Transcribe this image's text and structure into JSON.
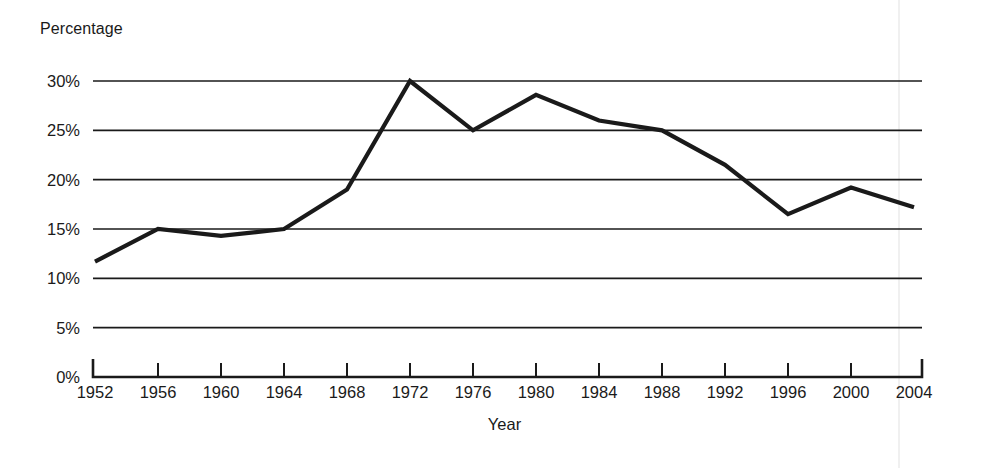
{
  "chart_data": {
    "type": "line",
    "title": "",
    "ylabel": "Percentage",
    "xlabel": "Year",
    "categories": [
      "1952",
      "1956",
      "1960",
      "1964",
      "1968",
      "1972",
      "1976",
      "1980",
      "1984",
      "1988",
      "1992",
      "1996",
      "2000",
      "2004"
    ],
    "x": [
      1952,
      1956,
      1960,
      1964,
      1968,
      1972,
      1976,
      1980,
      1984,
      1988,
      1992,
      1996,
      2000,
      2004
    ],
    "values": [
      11.7,
      15.0,
      14.3,
      15.0,
      19.0,
      30.0,
      25.0,
      28.6,
      26.0,
      25.0,
      21.5,
      16.5,
      19.2,
      17.2
    ],
    "ylim": [
      0,
      30
    ],
    "ytick_values": [
      0,
      5,
      10,
      15,
      20,
      25,
      30
    ],
    "ytick_labels": [
      "0%",
      "5%",
      "10%",
      "15%",
      "20%",
      "25%",
      "30%"
    ],
    "grid": "horizontal",
    "legend": "none",
    "series_color": "#1a1a1a",
    "grid_color": "#1a1a1a",
    "axis_color": "#1a1a1a",
    "background_color": "#ffffff"
  }
}
